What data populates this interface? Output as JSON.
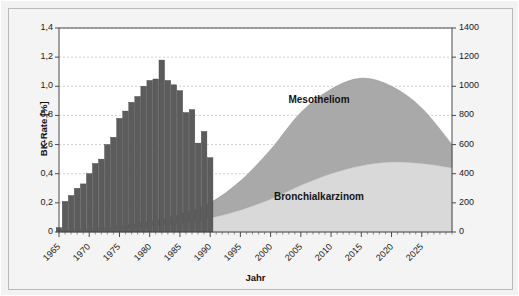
{
  "chart_data": {
    "type": "area",
    "title": "",
    "xlabel": "Jahr",
    "ylabel_left": "BK-Rate [%]",
    "ylabel_right": "BK-Rate [%]",
    "xlim": [
      1965,
      2030
    ],
    "ylim_left": [
      0,
      1.4
    ],
    "ylim_right": [
      0,
      1400
    ],
    "grid": true,
    "legend_position": "inside-plot-annotations",
    "xticks": [
      1965,
      1970,
      1975,
      1980,
      1985,
      1990,
      1995,
      2000,
      2005,
      2010,
      2015,
      2020,
      2025
    ],
    "xticklabels": [
      "1965",
      "1970",
      "1975",
      "1980",
      "1985",
      "1990",
      "1995",
      "2000",
      "2005",
      "2010",
      "2015",
      "2020",
      "2025"
    ],
    "yticks_left": [
      0,
      0.2,
      0.4,
      0.6,
      0.8,
      1.0,
      1.2,
      1.4
    ],
    "yticklabels_left": [
      "0",
      "0,2",
      "0,4",
      "0,6",
      "0,8",
      "1,0",
      "1,2",
      "1,4"
    ],
    "yticks_right": [
      0,
      200,
      400,
      600,
      800,
      1000,
      1200,
      1400
    ],
    "yticklabels_right": [
      "0",
      "200",
      "400",
      "600",
      "800",
      "1000",
      "1200",
      "1400"
    ],
    "annotations": [
      {
        "text": "Mesotheliom",
        "x": 2008,
        "y": 900
      },
      {
        "text": "Bronchialkarzinom",
        "x": 2008,
        "y": 230
      }
    ],
    "series": [
      {
        "name": "BK-Rate Balken",
        "type": "bar",
        "axis": "left",
        "color": "#5c5c5c",
        "x": [
          1965,
          1966,
          1967,
          1968,
          1969,
          1970,
          1971,
          1972,
          1973,
          1974,
          1975,
          1976,
          1977,
          1978,
          1979,
          1980,
          1981,
          1982,
          1983,
          1984,
          1985,
          1986,
          1987,
          1988,
          1989,
          1990
        ],
        "values": [
          0.03,
          0.21,
          0.25,
          0.3,
          0.33,
          0.4,
          0.47,
          0.5,
          0.6,
          0.65,
          0.78,
          0.83,
          0.89,
          0.93,
          1.0,
          1.04,
          1.05,
          1.18,
          1.04,
          1.01,
          0.97,
          0.82,
          0.84,
          0.61,
          0.69,
          0.51
        ]
      },
      {
        "name": "Bronchialkarzinom",
        "type": "area",
        "axis": "right",
        "color": "#d9d9d9",
        "x": [
          1965,
          1970,
          1975,
          1980,
          1985,
          1990,
          1995,
          2000,
          2005,
          2010,
          2015,
          2020,
          2025,
          2030
        ],
        "values": [
          5,
          12,
          22,
          38,
          60,
          95,
          150,
          225,
          320,
          400,
          455,
          480,
          470,
          440
        ]
      },
      {
        "name": "Mesotheliom",
        "type": "area",
        "axis": "right",
        "color": "#a9a9a9",
        "stacked_on": "Bronchialkarzinom",
        "x": [
          1965,
          1970,
          1975,
          1980,
          1985,
          1990,
          1995,
          2000,
          2005,
          2010,
          2015,
          2020,
          2025,
          2030
        ],
        "values": [
          3,
          8,
          18,
          32,
          60,
          105,
          200,
          340,
          500,
          580,
          600,
          520,
          380,
          160
        ]
      }
    ]
  },
  "axes": {
    "left_title": "BK-Rate [%]",
    "right_title": "BK-Rate [%]",
    "x_title": "Jahr"
  },
  "annotations": {
    "mesotheliom": "Mesotheliom",
    "bronchialkarzinom": "Bronchialkarzinom"
  },
  "colors": {
    "bar": "#5c5c5c",
    "mesotheliom": "#a9a9a9",
    "bronchialkarzinom": "#d9d9d9",
    "plot_bg": "#ffffff",
    "figure_bg": "#f4f4f4",
    "frame_border": "#b9b9b9",
    "grid": "#bdbdbd",
    "axis": "#4a4a4a",
    "text": "#141414"
  }
}
